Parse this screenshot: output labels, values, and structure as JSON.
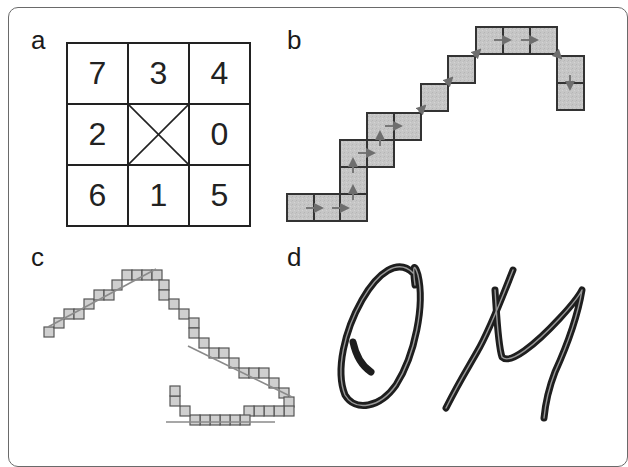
{
  "figure": {
    "panels": {
      "a": {
        "label": "a",
        "description": "8-direction Freeman chain code neighborhood",
        "grid": [
          [
            "7",
            "3",
            "4"
          ],
          [
            "2",
            "X",
            "0"
          ],
          [
            "6",
            "1",
            "5"
          ]
        ]
      },
      "b": {
        "label": "b",
        "description": "Chain of grid cells with direction arrows",
        "cell_size": 27,
        "fill_color": "#c8c8c8",
        "stroke_color": "#3a3a3a",
        "arrow_color": "#777777",
        "cells": [
          [
            287,
            194
          ],
          [
            314,
            194
          ],
          [
            340,
            194
          ],
          [
            340,
            167
          ],
          [
            340,
            140
          ],
          [
            367,
            140
          ],
          [
            367,
            113
          ],
          [
            394,
            113
          ],
          [
            421,
            84
          ],
          [
            448,
            56
          ],
          [
            476,
            27
          ],
          [
            503,
            27
          ],
          [
            530,
            27
          ],
          [
            557,
            56
          ],
          [
            557,
            83
          ]
        ]
      },
      "c": {
        "label": "c",
        "description": "Pixelated stroke with fitted line segments",
        "cell_size": 10,
        "fill_color": "#cfcfcf",
        "stroke_color": "#555555",
        "line_color": "#8a8a8a"
      },
      "d": {
        "label": "d",
        "description": "Handwritten characters",
        "text": "OM",
        "stroke_color": "#222222"
      }
    }
  }
}
